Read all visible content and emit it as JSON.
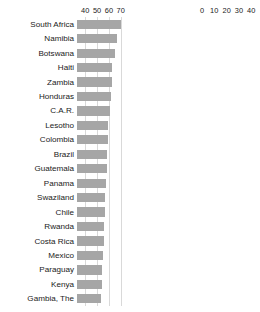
{
  "chart_data": [
    {
      "type": "bar",
      "title": "",
      "orientation": "horizontal",
      "panel": "left",
      "xlabel": "",
      "ylabel": "",
      "grid": true,
      "legend": null,
      "xlim": [
        33,
        74
      ],
      "ticks": [
        40,
        50,
        60,
        70
      ],
      "tick_labels": [
        "40",
        "50",
        "60",
        "70"
      ],
      "categories": [
        "South Africa",
        "Namibia",
        "Botswana",
        "Haiti",
        "Zambia",
        "Honduras",
        "C.A.R.",
        "Lesotho",
        "Colombia",
        "Brazil",
        "Guatemala",
        "Panama",
        "Swaziland",
        "Chile",
        "Rwanda",
        "Costa Rica",
        "Mexico",
        "Paraguay",
        "Kenya",
        "Gambia, The"
      ],
      "values": [
        70.0,
        67.0,
        65.0,
        62.5,
        63.0,
        61.5,
        61.0,
        59.5,
        59.0,
        58.5,
        58.0,
        57.5,
        57.0,
        56.5,
        56.0,
        55.5,
        55.0,
        54.5,
        54.0,
        53.5
      ]
    },
    {
      "type": "bar",
      "title": "",
      "orientation": "horizontal",
      "panel": "right",
      "xlabel": "",
      "ylabel": "",
      "grid": true,
      "legend": null,
      "xlim": [
        0,
        43
      ],
      "ticks": [
        0,
        10,
        20,
        30,
        40
      ],
      "tick_labels": [
        "0",
        "10",
        "20",
        "30",
        "40"
      ],
      "categories": [
        "Ukraine",
        "Slovenia",
        "Sweden",
        "Iceland",
        "Czech Republic",
        "Belarus",
        "Slovakia",
        "Norway",
        "Denmark",
        "Romania",
        "Finland",
        "Afghanistan",
        "Kazakhstan",
        "Hungary",
        "Netherlands",
        "Albania",
        "Iraq",
        "Pakistan",
        "Serbia",
        "Austria"
      ],
      "values": [
        25.5,
        25.6,
        25.8,
        26.0,
        26.1,
        26.3,
        26.5,
        26.8,
        27.0,
        27.2,
        27.4,
        27.6,
        27.8,
        28.0,
        28.2,
        28.4,
        28.6,
        28.8,
        29.0,
        29.2
      ]
    }
  ],
  "style": {
    "bar_color": "#a6a6a6",
    "grid_color": "#d9d9d9",
    "text_color": "#1a1a1a",
    "background": "#ffffff"
  }
}
